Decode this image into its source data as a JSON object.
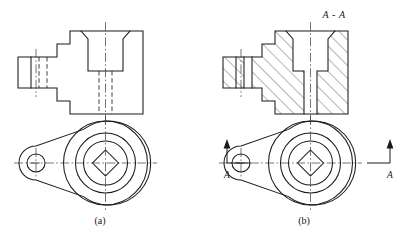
{
  "figure": {
    "background_color": "#ffffff",
    "line_color": "#1a1a1a",
    "hatch_color": "#2a2a2a"
  },
  "panels": [
    {
      "id": "panel-a",
      "caption": "(a)",
      "caption_position": {
        "x": 100,
        "y": 222
      },
      "description": "Unsectioned front view with hidden lines plus top view",
      "section_title": null,
      "has_hatching": false,
      "has_section_arrows": false
    },
    {
      "id": "panel-b",
      "caption": "(b)",
      "caption_position": {
        "x": 304,
        "y": 222
      },
      "description": "Full section front view A-A with hatching plus top view with cutting plane arrows",
      "section_title": "A - A",
      "section_title_position": {
        "x": 334,
        "y": 16
      },
      "has_hatching": true,
      "has_section_arrows": true
    }
  ],
  "annotations": {
    "section_title": "A - A",
    "cutting_plane_left_label": "A",
    "cutting_plane_right_label": "A",
    "cutting_plane_left_label_position": {
      "x": 227,
      "y": 175
    },
    "cutting_plane_right_label_position": {
      "x": 390,
      "y": 175
    },
    "arrow_direction": "up"
  },
  "views": {
    "front_view_a": {
      "name": "front-view-unsectioned",
      "label": "Front view (a)",
      "features": [
        "left cylindrical boss with hidden hole",
        "stepped flange body",
        "central counterbore with chamfer",
        "central through hole shown as hidden lines",
        "vertical centerlines"
      ]
    },
    "front_view_b": {
      "name": "front-view-section-aa",
      "label": "Section A-A (b)",
      "features": [
        "45 degree section hatching",
        "left boss cut through exposing hole",
        "central counterbore cut open",
        "central through hole cut open",
        "vertical centerlines"
      ]
    },
    "top_view_a": {
      "name": "top-view-a",
      "label": "Top view (a)",
      "features": [
        "teardrop outline",
        "small bolt hole circle at left",
        "three concentric circles at right",
        "square hole shown rotated 45 degrees as a diamond",
        "horizontal and vertical centerlines"
      ]
    },
    "top_view_b": {
      "name": "top-view-b",
      "label": "Top view (b)",
      "features": [
        "teardrop outline",
        "small bolt hole circle at left",
        "three concentric circles at right",
        "square hole shown rotated 45 degrees as a diamond",
        "cutting plane line with arrows labelled A at both ends"
      ]
    }
  },
  "geometry": {
    "front_a": {
      "origin_x": 18,
      "boss_left_x": 18,
      "boss_right_x": 57,
      "boss_top_y": 57,
      "boss_bottom_y": 88,
      "boss_inner_x": 31,
      "body_left_x": 57,
      "flange_left_x": 70,
      "body_right_x": 143,
      "body_top_y": 31,
      "body_bottom_y": 114,
      "flange_top_y": 44,
      "flange_bottom_y": 101,
      "counterbore_left_x": 88,
      "counterbore_right_x": 123,
      "counterbore_bottom_y": 71,
      "chamfer_out_left_x": 81,
      "chamfer_out_right_x": 130,
      "hole_left_x": 99,
      "hole_right_x": 112,
      "center_x": 105.5
    },
    "front_b": {
      "offset_x": 205
    },
    "top_a": {
      "center_big_x": 105.5,
      "center_big_y": 163,
      "r_outer": 42,
      "r_mid": 30,
      "r_inner": 22,
      "square_half": 13,
      "small_hole_x": 36,
      "small_hole_y": 163,
      "small_hole_r": 9
    },
    "top_b": {
      "offset_x": 205
    }
  }
}
